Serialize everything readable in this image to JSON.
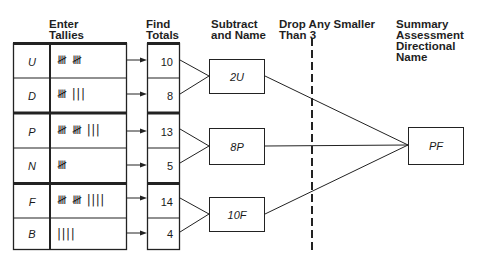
{
  "headers": {
    "enter_tallies": [
      "Enter",
      "Tallies"
    ],
    "find_totals": [
      "Find",
      "Totals"
    ],
    "subtract_and_name": [
      "Subtract",
      "and Name"
    ],
    "drop_smaller": [
      "Drop Any Smaller",
      "Than 3"
    ],
    "summary": [
      "Summary",
      "Assessment",
      "Directional",
      "Name"
    ]
  },
  "rows": [
    {
      "letter": "U",
      "tally": "𝍸 𝍸",
      "total": "10"
    },
    {
      "letter": "D",
      "tally": "𝍸 |||",
      "total": "8"
    },
    {
      "letter": "P",
      "tally": "𝍸 𝍸 |||",
      "total": "13"
    },
    {
      "letter": "N",
      "tally": "𝍸",
      "total": "5"
    },
    {
      "letter": "F",
      "tally": "𝍸 𝍸 ||||",
      "total": "14"
    },
    {
      "letter": "B",
      "tally": "||||",
      "total": "4"
    }
  ],
  "differences": [
    "2U",
    "8P",
    "10F"
  ],
  "summary_result": "PF",
  "colors": {
    "line": "#222222",
    "background": "#ffffff"
  }
}
